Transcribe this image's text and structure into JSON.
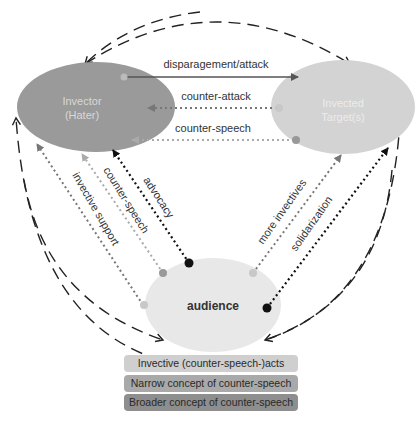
{
  "nodes": {
    "invector": {
      "line1": "Invector",
      "line2": "(Hater)",
      "color": "#9a9a9a",
      "text_color": "#d8d8d8"
    },
    "invected": {
      "line1": "Invected",
      "line2": "Target(s)",
      "color": "#d3d3d3",
      "text_color": "#ececec"
    },
    "audience": {
      "label": "audience",
      "color": "#e8e8e8",
      "text_color": "#333333"
    }
  },
  "edges": {
    "disparagement": "disparagement/attack",
    "counter_attack": "counter-attack",
    "counter_speech_top": "counter-speech",
    "invective_support": "invective support",
    "counter_speech_left": "counter-speech",
    "advocacy": "advocacy",
    "more_invectives": "more invectives",
    "solidarization": "solidarization"
  },
  "legend": [
    {
      "label": "Invective (counter-speech-)acts",
      "color": "#cfcfcf"
    },
    {
      "label": "Narrow concept of counter-speech",
      "color": "#a9a9a9"
    },
    {
      "label": "Broader concept of counter-speech",
      "color": "#8e8e8e"
    }
  ]
}
